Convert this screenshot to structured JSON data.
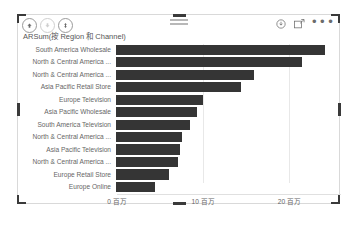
{
  "visual": {
    "title": "ARSum(按 Region 和 Channel)",
    "header": {
      "left_icons": [
        {
          "name": "drill-up-icon",
          "glyph": "up-arrow",
          "enabled": true
        },
        {
          "name": "drill-down-icon",
          "glyph": "down-arrow",
          "enabled": false
        },
        {
          "name": "expand-hierarchy-icon",
          "glyph": "split-arrows",
          "enabled": true
        }
      ],
      "right_icons": [
        {
          "name": "filter-icon",
          "glyph": "down-arrow-circle"
        },
        {
          "name": "focus-mode-icon",
          "glyph": "expand-box"
        },
        {
          "name": "more-options-icon",
          "glyph": "ellipsis",
          "label": "•••"
        }
      ],
      "drag_handle": {
        "name": "drag-handle-icon",
        "bars": 2
      }
    },
    "selection": {
      "selected": true,
      "handle_color": "#3a3a3a",
      "border_color": "#d9d9d9"
    }
  },
  "chart_data": {
    "type": "bar",
    "orientation": "horizontal",
    "title": "ARSum(按 Region 和 Channel)",
    "xlabel": "",
    "ylabel": "",
    "xlim": [
      0,
      26
    ],
    "x_unit": "百万",
    "grid": true,
    "legend": "none",
    "bar_color": "#353535",
    "label_color": "#666666",
    "tick_labels": [
      "0 百万",
      "10 百万",
      "20 百万"
    ],
    "tick_values": [
      0,
      10,
      20
    ],
    "categories": [
      "South America Wholesale",
      "North & Central America ...",
      "North & Central America ...",
      "Asia Pacific Retail Store",
      "Europe Television",
      "Asia Pacific Wholesale",
      "South America Television",
      "North & Central America ...",
      "Asia Pacific Television",
      "North & Central America ...",
      "Europe Retail Store",
      "Europe Online"
    ],
    "values": [
      24.2,
      21.5,
      16.0,
      14.4,
      10.1,
      9.4,
      8.6,
      7.6,
      7.4,
      7.2,
      6.1,
      4.5
    ]
  }
}
